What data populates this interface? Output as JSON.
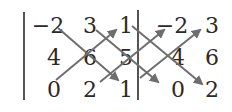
{
  "figure": {
    "matrix": [
      [
        "−2",
        "3",
        "1"
      ],
      [
        "4",
        "6",
        "5"
      ],
      [
        "0",
        "2",
        "1"
      ]
    ],
    "repeated_columns": [
      [
        "−2",
        "3"
      ],
      [
        "4",
        "6"
      ],
      [
        "0",
        "2"
      ]
    ],
    "colors": {
      "text": "#2a2a2a",
      "arrows": "#6e6e6e",
      "background": "#ffffff"
    },
    "arrows": {
      "down_right": [
        {
          "from": "r1c1",
          "to": "r3c3"
        },
        {
          "from": "r1c2",
          "to": "r3c4"
        },
        {
          "from": "r1c3",
          "to": "r3c5"
        }
      ],
      "up_right": [
        {
          "from": "r3c1",
          "to": "r1c3"
        },
        {
          "from": "r3c2",
          "to": "r1c4"
        },
        {
          "from": "r3c3",
          "to": "r1c5"
        }
      ]
    }
  }
}
